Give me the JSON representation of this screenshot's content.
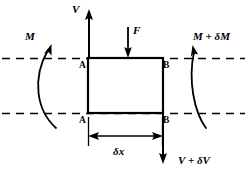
{
  "diagram": {
    "type": "free-body-diagram",
    "canvas": {
      "width": 247,
      "height": 180
    },
    "colors": {
      "stroke": "#000000",
      "background": "#ffffff"
    },
    "labels": {
      "shear_left": "V",
      "shear_right": "V + δV",
      "load": "F",
      "moment_left": "M",
      "moment_right": "M + δM",
      "length": "δx",
      "node_a_top": "A",
      "node_b_top": "B",
      "node_a_bottom": "A",
      "node_b_bottom": "B"
    },
    "elements": {
      "element_box": {
        "name": "beam-element",
        "x": 88,
        "y": 58,
        "width": 75,
        "height": 55
      },
      "neutral_axis_top": {
        "y": 58,
        "x1": 2,
        "x2": 245,
        "style": "dashed"
      },
      "neutral_axis_bottom": {
        "y": 113,
        "x1": 2,
        "x2": 245,
        "style": "dashed"
      },
      "shear_left_arrow": {
        "x": 88,
        "y_from": 58,
        "y_to": 12,
        "direction": "up"
      },
      "shear_right_arrow": {
        "x": 163,
        "y_from": 113,
        "y_to": 163,
        "direction": "down"
      },
      "load_arrow": {
        "x": 128,
        "y_from": 28,
        "y_to": 57,
        "direction": "down"
      },
      "moment_left_arc": {
        "direction": "counterclockwise",
        "arrowhead": "top"
      },
      "moment_right_arc": {
        "direction": "counterclockwise",
        "arrowhead": "top"
      },
      "dimension_line": {
        "y": 136,
        "x1": 88,
        "x2": 163,
        "arrowheads": "both"
      }
    }
  }
}
